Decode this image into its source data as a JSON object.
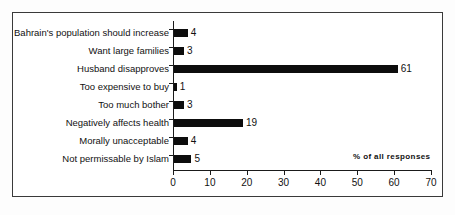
{
  "chart_data": {
    "type": "bar",
    "orientation": "horizontal",
    "title": "",
    "xlabel": "% of all responses",
    "ylabel": "",
    "xlim": [
      0,
      70
    ],
    "xticks": [
      0,
      10,
      20,
      30,
      40,
      50,
      60,
      70
    ],
    "grid": false,
    "legend": null,
    "bar_color": "#0d0d0d",
    "categories": [
      "Bahrain's population should increase",
      "Want large families",
      "Husband disapproves",
      "Too expensive to buy",
      "Too much bother",
      "Negatively affects health",
      "Morally unacceptable",
      "Not permissable by Islam"
    ],
    "values": [
      4,
      3,
      61,
      1,
      3,
      19,
      4,
      5
    ],
    "value_labels": [
      "4",
      "3",
      "61",
      "1",
      "3",
      "19",
      "4",
      "5"
    ],
    "tick_labels": [
      "0",
      "10",
      "20",
      "30",
      "40",
      "50",
      "60",
      "70"
    ],
    "axis_note": "% of all responses"
  }
}
